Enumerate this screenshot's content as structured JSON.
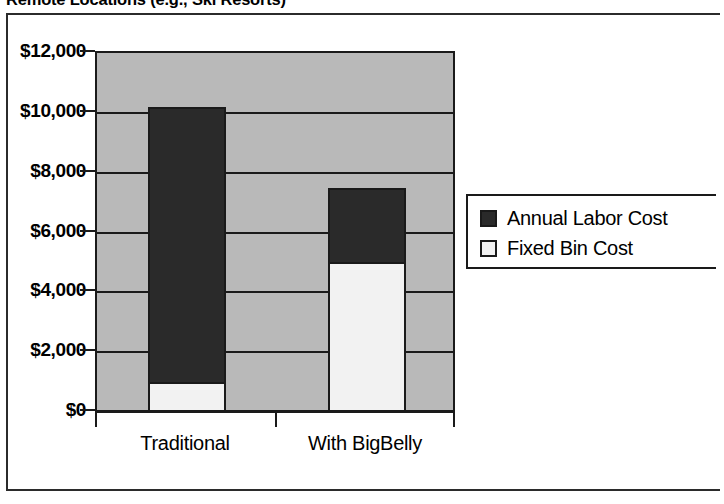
{
  "chart_data": {
    "type": "bar",
    "subtype": "stacked-bar",
    "title": "Remote Locations (e.g., Ski Resorts)",
    "xlabel": "",
    "ylabel": "",
    "categories": [
      "Traditional",
      "With BigBelly"
    ],
    "series": [
      {
        "name": "Fixed Bin Cost",
        "values": [
          1000,
          5000
        ],
        "color": "#f2f2f2"
      },
      {
        "name": "Annual Labor Cost",
        "values": [
          9200,
          2500
        ],
        "color": "#2a2a2a"
      }
    ],
    "totals": [
      10200,
      7500
    ],
    "ylim": [
      0,
      12000
    ],
    "ytick_values": [
      12000,
      10000,
      8000,
      6000,
      4000,
      2000,
      0
    ],
    "ytick_labels": [
      "$12,000",
      "$10,000",
      "$8,000",
      "$6,000",
      "$4,000",
      "$2,000",
      "$0"
    ],
    "grid": true,
    "grid_axis": "y",
    "legend_position": "right",
    "legend_order": [
      "Annual Labor Cost",
      "Fixed Bin Cost"
    ],
    "plot_background": "#b9b9b9",
    "axis_color": "#1a1a1a"
  },
  "legend": {
    "items": [
      {
        "label": "Annual Labor Cost",
        "swatch": "dark"
      },
      {
        "label": "Fixed Bin Cost",
        "swatch": "light"
      }
    ]
  }
}
